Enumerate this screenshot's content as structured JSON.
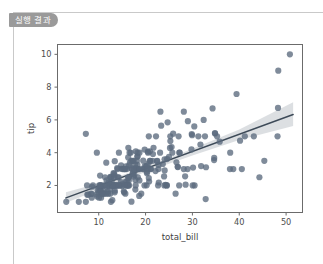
{
  "panel": {
    "tab_label": "실행 결과"
  },
  "colors": {
    "tab_background": "#9a9a9a",
    "tab_text": "#ffffff",
    "panel_border": "#c9c9c9",
    "point": "#5b6a7d",
    "regression_line": "#3d4a58",
    "confidence_band": "#d6d9dd",
    "axis_spine": "#6b6b6b",
    "tick_label": "#4d4d4d",
    "figure_background": "#ffffff"
  },
  "chart_data": {
    "type": "scatter",
    "title": "",
    "xlabel": "total_bill",
    "ylabel": "tip",
    "xlim": [
      1.2,
      53.5
    ],
    "ylim": [
      0.35,
      10.6
    ],
    "xticks": [
      10,
      20,
      30,
      40,
      50
    ],
    "yticks": [
      2,
      4,
      6,
      8,
      10
    ],
    "xtick_labels": [
      "10",
      "20",
      "30",
      "40",
      "50"
    ],
    "ytick_labels": [
      "2",
      "4",
      "6",
      "8",
      "10"
    ],
    "grid": false,
    "legend": null,
    "marker": {
      "size_px": 4.4,
      "color": "#5b6a7d",
      "opacity": 0.78,
      "edge": "none"
    },
    "regression": {
      "kind": "linear-fit-with-ci",
      "line_color": "#3d4a58",
      "line_width_px": 1.5,
      "band_color": "#d6d9dd",
      "band_opacity": 0.85,
      "intercept": 0.92,
      "slope": 0.105,
      "fit_x": [
        3.0,
        51.5
      ],
      "fit_y": [
        1.24,
        6.33
      ],
      "ci_lower_x": [
        3.0,
        10.0,
        20.0,
        30.0,
        40.0,
        51.5
      ],
      "ci_lower_y": [
        0.95,
        1.73,
        2.82,
        3.83,
        4.77,
        5.62
      ],
      "ci_upper_x": [
        3.0,
        10.0,
        20.0,
        30.0,
        40.0,
        51.5
      ],
      "ci_upper_y": [
        1.58,
        2.14,
        3.13,
        4.24,
        5.42,
        7.08
      ]
    },
    "points": [
      [
        16.99,
        1.01
      ],
      [
        10.34,
        1.66
      ],
      [
        21.01,
        3.5
      ],
      [
        23.68,
        3.31
      ],
      [
        24.59,
        3.61
      ],
      [
        25.29,
        4.71
      ],
      [
        8.77,
        2.0
      ],
      [
        26.88,
        3.12
      ],
      [
        15.04,
        1.96
      ],
      [
        14.78,
        3.23
      ],
      [
        10.27,
        1.71
      ],
      [
        35.26,
        5.0
      ],
      [
        15.42,
        1.57
      ],
      [
        18.43,
        3.0
      ],
      [
        14.83,
        3.02
      ],
      [
        21.58,
        3.92
      ],
      [
        10.33,
        1.67
      ],
      [
        16.29,
        3.71
      ],
      [
        16.97,
        3.5
      ],
      [
        20.65,
        3.35
      ],
      [
        17.92,
        4.08
      ],
      [
        20.29,
        2.75
      ],
      [
        15.77,
        2.23
      ],
      [
        39.42,
        7.58
      ],
      [
        19.82,
        3.18
      ],
      [
        17.81,
        2.34
      ],
      [
        13.37,
        2.0
      ],
      [
        12.69,
        2.0
      ],
      [
        21.7,
        4.3
      ],
      [
        19.65,
        3.0
      ],
      [
        9.55,
        1.45
      ],
      [
        18.35,
        2.5
      ],
      [
        15.06,
        3.0
      ],
      [
        20.69,
        2.45
      ],
      [
        17.78,
        3.27
      ],
      [
        24.06,
        3.6
      ],
      [
        16.31,
        2.0
      ],
      [
        16.93,
        3.07
      ],
      [
        18.69,
        2.31
      ],
      [
        31.27,
        5.0
      ],
      [
        16.04,
        2.24
      ],
      [
        17.46,
        2.54
      ],
      [
        13.94,
        3.06
      ],
      [
        9.68,
        1.32
      ],
      [
        30.4,
        5.6
      ],
      [
        18.29,
        3.0
      ],
      [
        22.23,
        5.0
      ],
      [
        32.4,
        6.0
      ],
      [
        28.55,
        2.05
      ],
      [
        18.04,
        3.0
      ],
      [
        12.54,
        2.5
      ],
      [
        10.29,
        2.6
      ],
      [
        34.81,
        5.2
      ],
      [
        9.94,
        1.56
      ],
      [
        25.56,
        4.34
      ],
      [
        19.49,
        3.51
      ],
      [
        38.01,
        3.0
      ],
      [
        26.41,
        1.5
      ],
      [
        11.24,
        1.76
      ],
      [
        48.27,
        6.73
      ],
      [
        20.29,
        3.21
      ],
      [
        13.81,
        2.0
      ],
      [
        11.02,
        1.98
      ],
      [
        18.29,
        3.76
      ],
      [
        17.59,
        2.64
      ],
      [
        20.08,
        3.15
      ],
      [
        16.45,
        2.47
      ],
      [
        3.07,
        1.0
      ],
      [
        20.23,
        2.01
      ],
      [
        15.01,
        2.09
      ],
      [
        12.02,
        1.97
      ],
      [
        17.07,
        3.0
      ],
      [
        26.86,
        3.14
      ],
      [
        25.28,
        5.0
      ],
      [
        14.73,
        2.2
      ],
      [
        10.51,
        1.25
      ],
      [
        17.92,
        3.08
      ],
      [
        27.2,
        4.0
      ],
      [
        22.76,
        3.0
      ],
      [
        17.29,
        2.71
      ],
      [
        19.44,
        3.0
      ],
      [
        16.66,
        3.4
      ],
      [
        10.07,
        1.83
      ],
      [
        32.68,
        5.0
      ],
      [
        15.98,
        2.03
      ],
      [
        34.83,
        5.17
      ],
      [
        13.03,
        2.0
      ],
      [
        18.28,
        4.0
      ],
      [
        24.71,
        5.85
      ],
      [
        21.16,
        3.0
      ],
      [
        28.97,
        3.0
      ],
      [
        22.49,
        3.5
      ],
      [
        5.75,
        1.0
      ],
      [
        16.32,
        4.3
      ],
      [
        22.75,
        3.25
      ],
      [
        40.17,
        4.73
      ],
      [
        27.28,
        4.0
      ],
      [
        12.03,
        1.5
      ],
      [
        21.01,
        3.0
      ],
      [
        12.46,
        1.5
      ],
      [
        11.35,
        2.5
      ],
      [
        15.38,
        3.0
      ],
      [
        44.3,
        2.5
      ],
      [
        22.42,
        3.48
      ],
      [
        20.92,
        4.08
      ],
      [
        15.36,
        1.64
      ],
      [
        20.49,
        4.06
      ],
      [
        25.21,
        4.29
      ],
      [
        18.24,
        3.76
      ],
      [
        14.31,
        4.0
      ],
      [
        14.0,
        3.0
      ],
      [
        7.25,
        1.0
      ],
      [
        38.07,
        4.0
      ],
      [
        23.95,
        2.55
      ],
      [
        25.71,
        4.0
      ],
      [
        17.31,
        3.5
      ],
      [
        29.93,
        5.07
      ],
      [
        10.65,
        1.5
      ],
      [
        12.43,
        1.8
      ],
      [
        24.08,
        2.92
      ],
      [
        11.69,
        2.31
      ],
      [
        13.42,
        1.68
      ],
      [
        14.26,
        2.5
      ],
      [
        15.95,
        2.0
      ],
      [
        12.48,
        2.52
      ],
      [
        29.8,
        4.2
      ],
      [
        8.52,
        1.48
      ],
      [
        14.52,
        2.0
      ],
      [
        11.38,
        2.0
      ],
      [
        22.82,
        2.18
      ],
      [
        19.08,
        1.5
      ],
      [
        20.27,
        2.83
      ],
      [
        11.17,
        1.5
      ],
      [
        12.26,
        2.0
      ],
      [
        18.26,
        3.25
      ],
      [
        8.51,
        1.25
      ],
      [
        10.33,
        2.0
      ],
      [
        14.15,
        2.0
      ],
      [
        16.0,
        2.0
      ],
      [
        13.16,
        2.75
      ],
      [
        17.47,
        3.5
      ],
      [
        34.3,
        6.7
      ],
      [
        41.19,
        5.0
      ],
      [
        27.05,
        5.0
      ],
      [
        16.43,
        2.3
      ],
      [
        8.35,
        1.5
      ],
      [
        18.64,
        1.36
      ],
      [
        11.87,
        1.63
      ],
      [
        9.78,
        1.73
      ],
      [
        7.51,
        2.0
      ],
      [
        14.07,
        2.5
      ],
      [
        13.13,
        2.0
      ],
      [
        17.26,
        2.74
      ],
      [
        24.55,
        2.0
      ],
      [
        19.77,
        2.0
      ],
      [
        29.85,
        5.14
      ],
      [
        48.17,
        5.0
      ],
      [
        25.0,
        3.75
      ],
      [
        13.39,
        2.61
      ],
      [
        16.49,
        2.0
      ],
      [
        21.5,
        3.5
      ],
      [
        12.66,
        2.5
      ],
      [
        16.21,
        2.0
      ],
      [
        13.81,
        2.0
      ],
      [
        17.51,
        3.0
      ],
      [
        24.52,
        2.0
      ],
      [
        20.76,
        2.24
      ],
      [
        31.71,
        4.5
      ],
      [
        10.59,
        1.61
      ],
      [
        10.63,
        2.0
      ],
      [
        50.81,
        10.0
      ],
      [
        15.81,
        3.16
      ],
      [
        7.25,
        5.15
      ],
      [
        31.85,
        3.18
      ],
      [
        16.82,
        4.0
      ],
      [
        32.9,
        3.11
      ],
      [
        17.89,
        2.0
      ],
      [
        14.48,
        2.0
      ],
      [
        9.6,
        4.0
      ],
      [
        34.63,
        3.55
      ],
      [
        34.65,
        3.68
      ],
      [
        23.33,
        5.65
      ],
      [
        45.35,
        3.5
      ],
      [
        23.17,
        6.5
      ],
      [
        40.55,
        3.0
      ],
      [
        20.69,
        5.0
      ],
      [
        20.9,
        3.5
      ],
      [
        30.46,
        2.0
      ],
      [
        18.15,
        3.5
      ],
      [
        23.1,
        4.0
      ],
      [
        15.69,
        1.5
      ],
      [
        19.81,
        4.19
      ],
      [
        28.44,
        2.56
      ],
      [
        15.48,
        2.02
      ],
      [
        16.58,
        4.0
      ],
      [
        7.56,
        1.44
      ],
      [
        10.34,
        2.0
      ],
      [
        43.11,
        5.0
      ],
      [
        13.0,
        2.0
      ],
      [
        13.51,
        2.0
      ],
      [
        18.71,
        4.0
      ],
      [
        12.74,
        2.01
      ],
      [
        13.0,
        2.0
      ],
      [
        16.4,
        2.5
      ],
      [
        20.53,
        4.0
      ],
      [
        16.47,
        3.23
      ],
      [
        26.59,
        3.41
      ],
      [
        38.73,
        3.0
      ],
      [
        24.27,
        2.03
      ],
      [
        12.76,
        2.23
      ],
      [
        30.06,
        2.0
      ],
      [
        25.89,
        5.16
      ],
      [
        48.33,
        9.0
      ],
      [
        13.27,
        2.5
      ],
      [
        28.17,
        6.5
      ],
      [
        12.9,
        1.1
      ],
      [
        28.15,
        3.0
      ],
      [
        11.59,
        1.5
      ],
      [
        7.74,
        1.44
      ],
      [
        30.14,
        3.09
      ],
      [
        12.16,
        2.2
      ],
      [
        13.42,
        3.48
      ],
      [
        8.58,
        1.92
      ],
      [
        15.98,
        3.0
      ],
      [
        13.42,
        1.58
      ],
      [
        16.27,
        2.5
      ],
      [
        10.09,
        2.0
      ],
      [
        20.45,
        3.0
      ],
      [
        13.28,
        2.72
      ],
      [
        22.12,
        2.88
      ],
      [
        24.01,
        2.0
      ],
      [
        15.69,
        3.0
      ],
      [
        11.61,
        3.39
      ],
      [
        10.77,
        1.47
      ],
      [
        15.53,
        3.0
      ],
      [
        10.07,
        1.25
      ],
      [
        12.6,
        1.0
      ],
      [
        32.83,
        1.17
      ],
      [
        35.83,
        4.67
      ],
      [
        29.03,
        5.92
      ],
      [
        27.18,
        2.0
      ],
      [
        22.67,
        2.0
      ],
      [
        17.82,
        1.75
      ],
      [
        18.78,
        3.0
      ]
    ]
  }
}
